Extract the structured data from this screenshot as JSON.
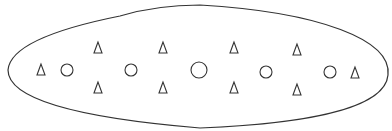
{
  "diagram": {
    "background": "#ffffff",
    "stroke_color": "#333333",
    "outline": {
      "shape": "elongated-oval",
      "path": "M 120 16 C 60 28, 10 45, 8 70 C 8 100, 80 118, 200 128 C 300 124, 385 110, 388 75 C 392 40, 320 12, 200 5 C 170 5, 140 10, 120 16 Z"
    },
    "triangles": [
      {
        "x": 41,
        "y": 70
      },
      {
        "x": 98,
        "y": 48
      },
      {
        "x": 98,
        "y": 88
      },
      {
        "x": 163,
        "y": 48
      },
      {
        "x": 163,
        "y": 88
      },
      {
        "x": 234,
        "y": 48
      },
      {
        "x": 234,
        "y": 88
      },
      {
        "x": 297,
        "y": 50
      },
      {
        "x": 297,
        "y": 90
      },
      {
        "x": 355,
        "y": 73
      }
    ],
    "circles": [
      {
        "x": 67,
        "y": 70,
        "r": 6
      },
      {
        "x": 131,
        "y": 70,
        "r": 6
      },
      {
        "x": 199,
        "y": 70,
        "r": 8
      },
      {
        "x": 266,
        "y": 72,
        "r": 6
      },
      {
        "x": 330,
        "y": 72,
        "r": 6
      }
    ]
  }
}
